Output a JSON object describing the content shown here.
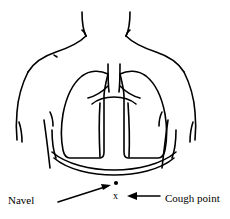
{
  "figure": {
    "background_color": "#ffffff",
    "ink_color": "#000000",
    "width": 230,
    "height": 219
  },
  "labels": {
    "navel": "Navel",
    "cough_point": "Cough point"
  },
  "markers": {
    "navel_dot": "•",
    "cough_point_x": "x"
  },
  "anatomy": {
    "parts": [
      "neck",
      "left-shoulder",
      "right-shoulder",
      "left-arm",
      "right-arm",
      "torso",
      "left-lung",
      "right-lung",
      "trachea",
      "bronchi",
      "mediastinum",
      "diaphragm",
      "left-costal-margin",
      "right-costal-margin"
    ]
  },
  "annotations": {
    "navel_arrow": "arrow-up-right",
    "cough_arrow": "arrow-left"
  }
}
